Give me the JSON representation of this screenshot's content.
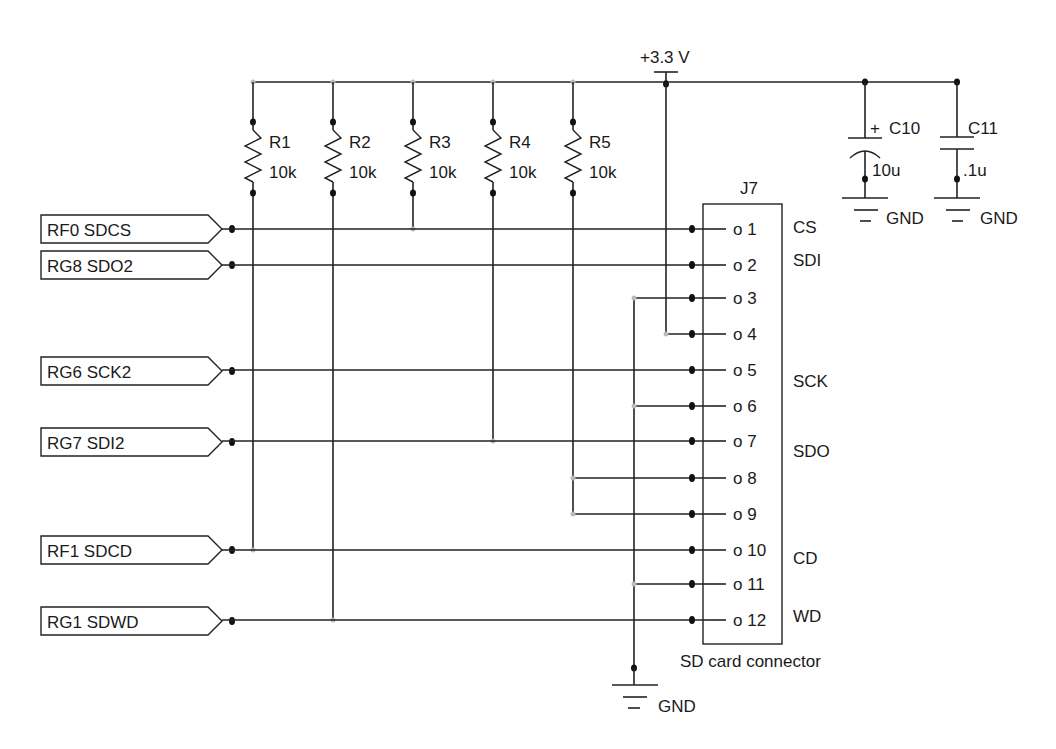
{
  "power": {
    "label": "+3.3 V"
  },
  "resistors": [
    {
      "ref": "R1",
      "value": "10k"
    },
    {
      "ref": "R2",
      "value": "10k"
    },
    {
      "ref": "R3",
      "value": "10k"
    },
    {
      "ref": "R4",
      "value": "10k"
    },
    {
      "ref": "R5",
      "value": "10k"
    }
  ],
  "capacitors": [
    {
      "ref": "C10",
      "value": "10u",
      "polarity": "+",
      "gnd": "GND"
    },
    {
      "ref": "C11",
      "value": ".1u",
      "gnd": "GND"
    }
  ],
  "connector": {
    "ref": "J7",
    "caption": "SD card connector",
    "pins": [
      {
        "num": "o 1",
        "func": "CS"
      },
      {
        "num": "o 2",
        "func": "SDI"
      },
      {
        "num": "o 3",
        "func": ""
      },
      {
        "num": "o 4",
        "func": ""
      },
      {
        "num": "o 5",
        "func": "SCK"
      },
      {
        "num": "o 6",
        "func": ""
      },
      {
        "num": "o 7",
        "func": "SDO"
      },
      {
        "num": "o 8",
        "func": ""
      },
      {
        "num": "o 9",
        "func": ""
      },
      {
        "num": "o 10",
        "func": "CD"
      },
      {
        "num": "o 11",
        "func": ""
      },
      {
        "num": "o 12",
        "func": "WD"
      }
    ]
  },
  "net_labels": [
    {
      "text": "RF0 SDCS",
      "pin": 1
    },
    {
      "text": "RG8 SDO2",
      "pin": 2
    },
    {
      "text": "RG6 SCK2",
      "pin": 5
    },
    {
      "text": "RG7 SDI2",
      "pin": 7
    },
    {
      "text": "RF1 SDCD",
      "pin": 10
    },
    {
      "text": "RG1 SDWD",
      "pin": 12
    }
  ],
  "ground": {
    "label": "GND"
  }
}
